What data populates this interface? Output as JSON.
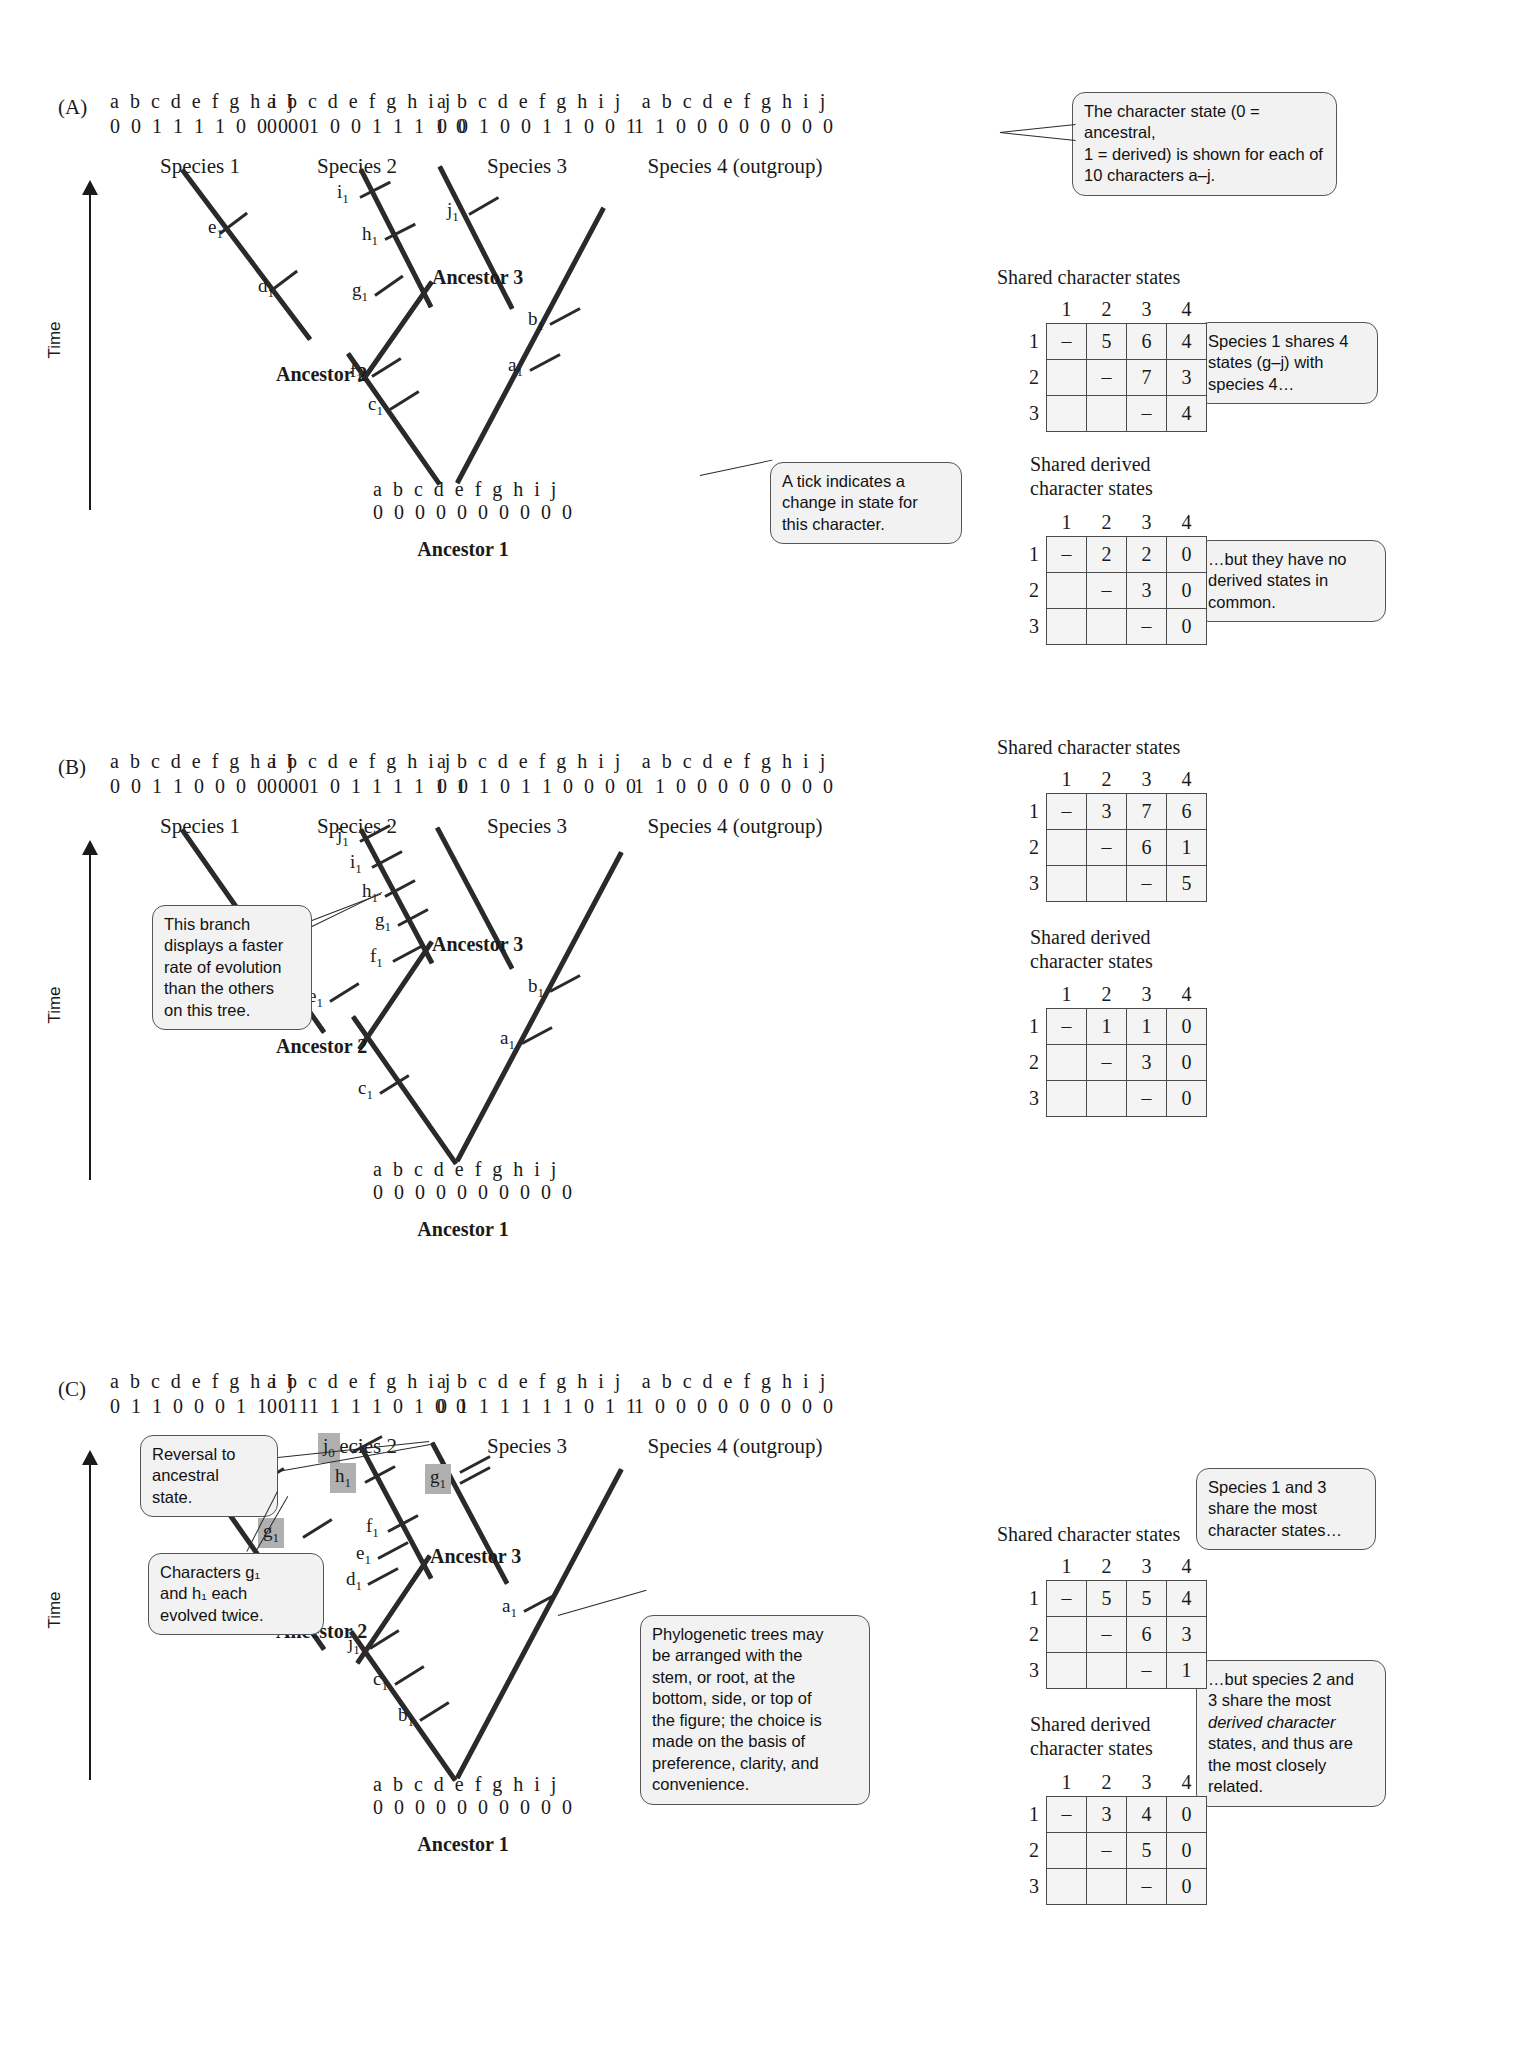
{
  "figure": {
    "time_axis_label": "Time",
    "character_letters": "a b c d e f g h i j"
  },
  "panels": [
    {
      "label": "(A)",
      "species": [
        {
          "name": "Species 1",
          "letters": "a b c d e f g h i j",
          "states": "0 0 1 1 1 1 0 0 0 0"
        },
        {
          "name": "Species 2",
          "letters": "a b c d e f g h i j",
          "states": "0 0 1 0 0 1 1 1 1 0"
        },
        {
          "name": "Species 3",
          "letters": "a b c d e f g h i j",
          "states": "0 0 1 0 0 1 1 0 0 1"
        },
        {
          "name": "Species 4 (outgroup)",
          "letters": "a b c d e f g h i j",
          "states": "1 1 0 0 0 0 0 0 0 0"
        }
      ],
      "root": {
        "letters": "a b c d e f g h i j",
        "states": "0 0 0 0 0 0 0 0 0 0",
        "name": "Ancestor 1"
      },
      "ancestors": [
        "Ancestor 2",
        "Ancestor 3"
      ],
      "ticks": [
        {
          "label": "e",
          "sub": "1"
        },
        {
          "label": "d",
          "sub": "1"
        },
        {
          "label": "i",
          "sub": "1"
        },
        {
          "label": "h",
          "sub": "1"
        },
        {
          "label": "g",
          "sub": "1"
        },
        {
          "label": "j",
          "sub": "1"
        },
        {
          "label": "b",
          "sub": "1"
        },
        {
          "label": "a",
          "sub": "1"
        },
        {
          "label": "f",
          "sub": "1"
        },
        {
          "label": "c",
          "sub": "1"
        }
      ],
      "callouts": [
        {
          "id": "char-state-note",
          "lines": [
            "The character state (0 = ancestral,",
            "1 = derived) is shown for each of",
            "10 characters a–j."
          ]
        },
        {
          "id": "tick-note",
          "lines": [
            "A tick indicates a",
            "change in state for",
            "this character."
          ]
        },
        {
          "id": "shared-note",
          "lines": [
            "Species 1 shares 4",
            "states (g–j) with",
            "species 4…"
          ]
        },
        {
          "id": "derived-note",
          "lines": [
            "…but they have no",
            "derived states in",
            "common."
          ]
        }
      ],
      "tables": [
        {
          "title": [
            "Shared character states"
          ],
          "col_headers": [
            "1",
            "2",
            "3",
            "4"
          ],
          "row_headers": [
            "1",
            "2",
            "3"
          ],
          "rows": [
            [
              "–",
              "5",
              "6",
              "4"
            ],
            [
              "",
              "–",
              "7",
              "3"
            ],
            [
              "",
              "",
              "–",
              "4"
            ]
          ]
        },
        {
          "title": [
            "Shared derived",
            "character states"
          ],
          "col_headers": [
            "1",
            "2",
            "3",
            "4"
          ],
          "row_headers": [
            "1",
            "2",
            "3"
          ],
          "rows": [
            [
              "–",
              "2",
              "2",
              "0"
            ],
            [
              "",
              "–",
              "3",
              "0"
            ],
            [
              "",
              "",
              "–",
              "0"
            ]
          ]
        }
      ]
    },
    {
      "label": "(B)",
      "species": [
        {
          "name": "Species 1",
          "letters": "a b c d e f g h i j",
          "states": "0 0 1 1 0 0 0 0 0 0"
        },
        {
          "name": "Species 2",
          "letters": "a b c d e f g h i j",
          "states": "0 0 1 0 1 1 1 1 1 1"
        },
        {
          "name": "Species 3",
          "letters": "a b c d e f g h i j",
          "states": "0 0 1 0 1 1 0 0 0 0"
        },
        {
          "name": "Species 4 (outgroup)",
          "letters": "a b c d e f g h i j",
          "states": "1 1 0 0 0 0 0 0 0 0"
        }
      ],
      "root": {
        "letters": "a b c d e f g h i j",
        "states": "0 0 0 0 0 0 0 0 0 0",
        "name": "Ancestor 1"
      },
      "ancestors": [
        "Ancestor 2",
        "Ancestor 3"
      ],
      "ticks": [
        {
          "label": "j",
          "sub": "1"
        },
        {
          "label": "i",
          "sub": "1"
        },
        {
          "label": "h",
          "sub": "1"
        },
        {
          "label": "g",
          "sub": "1"
        },
        {
          "label": "d",
          "sub": "1"
        },
        {
          "label": "f",
          "sub": "1"
        },
        {
          "label": "e",
          "sub": "1"
        },
        {
          "label": "b",
          "sub": "1"
        },
        {
          "label": "a",
          "sub": "1"
        },
        {
          "label": "c",
          "sub": "1"
        }
      ],
      "callouts": [
        {
          "id": "fast-rate-note",
          "lines": [
            "This branch",
            "displays a faster",
            "rate of evolution",
            "than the others",
            "on this tree."
          ]
        },
        {
          "id": "shared-note",
          "lines": [
            "Species 1 and 3",
            "share the most",
            "character states…"
          ]
        },
        {
          "id": "derived-note",
          "lines": [
            "…but species 2 and",
            "3 share the most",
            "derived character",
            "states, and thus are",
            "the most closely",
            "related."
          ]
        }
      ],
      "tables": [
        {
          "title": [
            "Shared character states"
          ],
          "col_headers": [
            "1",
            "2",
            "3",
            "4"
          ],
          "row_headers": [
            "1",
            "2",
            "3"
          ],
          "rows": [
            [
              "–",
              "3",
              "7",
              "6"
            ],
            [
              "",
              "–",
              "6",
              "1"
            ],
            [
              "",
              "",
              "–",
              "5"
            ]
          ]
        },
        {
          "title": [
            "Shared derived",
            "character states"
          ],
          "col_headers": [
            "1",
            "2",
            "3",
            "4"
          ],
          "row_headers": [
            "1",
            "2",
            "3"
          ],
          "rows": [
            [
              "–",
              "1",
              "1",
              "0"
            ],
            [
              "",
              "–",
              "3",
              "0"
            ],
            [
              "",
              "",
              "–",
              "0"
            ]
          ]
        }
      ]
    },
    {
      "label": "(C)",
      "species": [
        {
          "name": "Species 1",
          "letters": "a b c d e f g h i j",
          "states": "0 1 1 0 0 0 1 1 0 1"
        },
        {
          "name": "Species 2",
          "letters": "a b c d e f g h i j",
          "states": "0 1 1 1 1 1 0 1 0 0"
        },
        {
          "name": "Species 3",
          "letters": "a b c d e f g h i j",
          "states": "0 1 1 1 1 1 1 0 1 1"
        },
        {
          "name": "Species 4 (outgroup)",
          "letters": "a b c d e f g h i j",
          "states": "1 0 0 0 0 0 0 0 0 0"
        }
      ],
      "root": {
        "letters": "a b c d e f g h i j",
        "states": "0 0 0 0 0 0 0 0 0 0",
        "name": "Ancestor 1"
      },
      "ancestors": [
        "Ancestor 2",
        "Ancestor 3"
      ],
      "ticks": [
        {
          "label": "h",
          "sub": "1",
          "highlight": true
        },
        {
          "label": "g",
          "sub": "1",
          "highlight": true
        },
        {
          "label": "j",
          "sub": "0",
          "highlight": true
        },
        {
          "label": "h",
          "sub": "1",
          "highlight": true
        },
        {
          "label": "g",
          "sub": "1",
          "highlight": true
        },
        {
          "label": "i",
          "sub": "1"
        },
        {
          "label": "f",
          "sub": "1"
        },
        {
          "label": "e",
          "sub": "1"
        },
        {
          "label": "d",
          "sub": "1"
        },
        {
          "label": "a",
          "sub": "1"
        },
        {
          "label": "j",
          "sub": "1"
        },
        {
          "label": "c",
          "sub": "1"
        },
        {
          "label": "b",
          "sub": "1"
        }
      ],
      "callouts": [
        {
          "id": "reversal-note",
          "lines": [
            "Reversal to",
            "ancestral",
            "state."
          ]
        },
        {
          "id": "twice-evolved-note",
          "lines": [
            "Characters g₁",
            "and h₁ each",
            "evolved twice."
          ]
        },
        {
          "id": "arrangement-note",
          "lines": [
            "Phylogenetic trees may",
            "be arranged with the",
            "stem, or root, at the",
            "bottom, side, or top of",
            "the figure; the choice is",
            "made on the basis of",
            "preference, clarity, and",
            "convenience."
          ]
        }
      ],
      "tables": [
        {
          "title": [
            "Shared character states"
          ],
          "col_headers": [
            "1",
            "2",
            "3",
            "4"
          ],
          "row_headers": [
            "1",
            "2",
            "3"
          ],
          "rows": [
            [
              "–",
              "5",
              "5",
              "4"
            ],
            [
              "",
              "–",
              "6",
              "3"
            ],
            [
              "",
              "",
              "–",
              "1"
            ]
          ]
        },
        {
          "title": [
            "Shared derived",
            "character states"
          ],
          "col_headers": [
            "1",
            "2",
            "3",
            "4"
          ],
          "row_headers": [
            "1",
            "2",
            "3"
          ],
          "rows": [
            [
              "–",
              "3",
              "4",
              "0"
            ],
            [
              "",
              "–",
              "5",
              "0"
            ],
            [
              "",
              "",
              "–",
              "0"
            ]
          ]
        }
      ]
    }
  ]
}
